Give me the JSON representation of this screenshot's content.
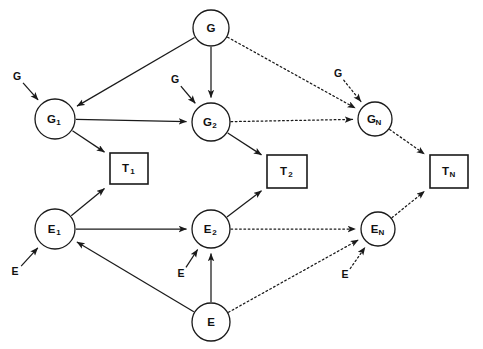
{
  "diagram": {
    "canvas": {
      "width": 483,
      "height": 349,
      "background": "#ffffff"
    },
    "stroke_color": "#1a1a1a",
    "nodes": [
      {
        "id": "G",
        "kind": "circle",
        "label": "G",
        "sub": "",
        "cx": 211,
        "cy": 28,
        "r": 18
      },
      {
        "id": "G1",
        "kind": "circle",
        "label": "G",
        "sub": "1",
        "cx": 55,
        "cy": 119,
        "r": 20
      },
      {
        "id": "G2",
        "kind": "circle",
        "label": "G",
        "sub": "2",
        "cx": 211,
        "cy": 122,
        "r": 19
      },
      {
        "id": "GN",
        "kind": "circle",
        "label": "G",
        "sub": "N",
        "cx": 375,
        "cy": 119,
        "r": 17
      },
      {
        "id": "E1",
        "kind": "circle",
        "label": "E",
        "sub": "1",
        "cx": 55,
        "cy": 229,
        "r": 20
      },
      {
        "id": "E2",
        "kind": "circle",
        "label": "E",
        "sub": "2",
        "cx": 211,
        "cy": 229,
        "r": 19
      },
      {
        "id": "EN",
        "kind": "circle",
        "label": "E",
        "sub": "N",
        "cx": 378,
        "cy": 229,
        "r": 17
      },
      {
        "id": "E",
        "kind": "circle",
        "label": "E",
        "sub": "",
        "cx": 211,
        "cy": 322,
        "r": 19
      },
      {
        "id": "T1",
        "kind": "box",
        "label": "T",
        "sub": "1",
        "x": 110,
        "y": 153,
        "w": 38,
        "h": 31
      },
      {
        "id": "T2",
        "kind": "box",
        "label": "T",
        "sub": "2",
        "x": 267,
        "y": 155,
        "w": 40,
        "h": 33
      },
      {
        "id": "TN",
        "kind": "box",
        "label": "T",
        "sub": "N",
        "x": 430,
        "y": 155,
        "w": 38,
        "h": 33
      }
    ],
    "input_labels": [
      {
        "id": "in-G-G1",
        "text": "G",
        "x": 17,
        "y": 77,
        "target": "G1"
      },
      {
        "id": "in-G-G2",
        "text": "G",
        "x": 175,
        "y": 80,
        "target": "G2"
      },
      {
        "id": "in-G-GN",
        "text": "G",
        "x": 338,
        "y": 74,
        "target": "GN"
      },
      {
        "id": "in-E-E1",
        "text": "E",
        "x": 15,
        "y": 272,
        "target": "E1"
      },
      {
        "id": "in-E-E2",
        "text": "E",
        "x": 181,
        "y": 274,
        "target": "E2"
      },
      {
        "id": "in-E-EN",
        "text": "E",
        "x": 345,
        "y": 275,
        "target": "EN"
      }
    ],
    "edges": [
      {
        "id": "e-G-G1",
        "from": "G",
        "to": "G1",
        "style": "solid",
        "arrow": true
      },
      {
        "id": "e-G-G2",
        "from": "G",
        "to": "G2",
        "style": "solid",
        "arrow": true
      },
      {
        "id": "e-G-GN",
        "from": "G",
        "to": "GN",
        "style": "dotted",
        "arrow": true
      },
      {
        "id": "e-G1-G2",
        "from": "G1",
        "to": "G2",
        "style": "solid",
        "arrow": true
      },
      {
        "id": "e-G1-T1",
        "from": "G1",
        "to": "T1",
        "style": "solid",
        "arrow": true
      },
      {
        "id": "e-G2-GN",
        "from": "G2",
        "to": "GN",
        "style": "dotted",
        "arrow": true
      },
      {
        "id": "e-G2-T2",
        "from": "G2",
        "to": "T2",
        "style": "solid",
        "arrow": true
      },
      {
        "id": "e-GN-TN",
        "from": "GN",
        "to": "TN",
        "style": "dotted",
        "arrow": true
      },
      {
        "id": "e-E1-T1",
        "from": "E1",
        "to": "T1",
        "style": "solid",
        "arrow": true
      },
      {
        "id": "e-E1-E2",
        "from": "E1",
        "to": "E2",
        "style": "solid",
        "arrow": true
      },
      {
        "id": "e-E2-T2",
        "from": "E2",
        "to": "T2",
        "style": "solid",
        "arrow": true
      },
      {
        "id": "e-E2-EN",
        "from": "E2",
        "to": "EN",
        "style": "dotted",
        "arrow": true
      },
      {
        "id": "e-EN-TN",
        "from": "EN",
        "to": "TN",
        "style": "dotted",
        "arrow": true
      },
      {
        "id": "e-E-E1",
        "from": "E",
        "to": "E1",
        "style": "solid",
        "arrow": true
      },
      {
        "id": "e-E-E2",
        "from": "E",
        "to": "E2",
        "style": "solid",
        "arrow": true
      },
      {
        "id": "e-E-EN",
        "from": "E",
        "to": "EN",
        "style": "dotted",
        "arrow": true
      }
    ]
  }
}
